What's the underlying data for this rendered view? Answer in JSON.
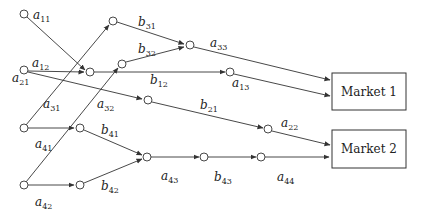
{
  "diagram": {
    "markets": [
      {
        "id": "m1",
        "label": "Market 1"
      },
      {
        "id": "m2",
        "label": "Market 2"
      }
    ],
    "labels": {
      "a11": {
        "base": "a",
        "sub": "11"
      },
      "a12": {
        "base": "a",
        "sub": "12"
      },
      "a21": {
        "base": "a",
        "sub": "21"
      },
      "a31": {
        "base": "a",
        "sub": "31"
      },
      "a32": {
        "base": "a",
        "sub": "32"
      },
      "a41": {
        "base": "a",
        "sub": "41"
      },
      "a42": {
        "base": "a",
        "sub": "42"
      },
      "b31": {
        "base": "b",
        "sub": "31"
      },
      "b32": {
        "base": "b",
        "sub": "32"
      },
      "a33": {
        "base": "a",
        "sub": "33"
      },
      "b12": {
        "base": "b",
        "sub": "12"
      },
      "a13": {
        "base": "a",
        "sub": "13"
      },
      "b21": {
        "base": "b",
        "sub": "21"
      },
      "a22": {
        "base": "a",
        "sub": "22"
      },
      "b41": {
        "base": "b",
        "sub": "41"
      },
      "b42": {
        "base": "b",
        "sub": "42"
      },
      "a43": {
        "base": "a",
        "sub": "43"
      },
      "b43": {
        "base": "b",
        "sub": "43"
      },
      "a44": {
        "base": "a",
        "sub": "44"
      }
    }
  }
}
